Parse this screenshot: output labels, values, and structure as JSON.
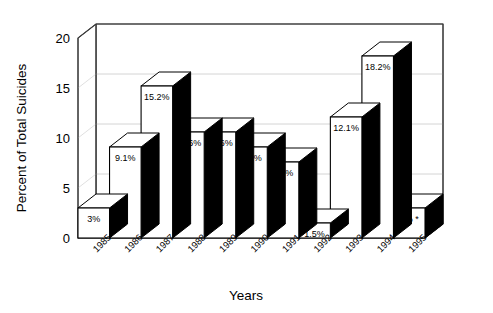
{
  "chart_data": {
    "type": "bar",
    "title": "",
    "subtitle": "",
    "xlabel": "Years",
    "ylabel": "Percent of Total Suicides",
    "categories": [
      "1985",
      "1986",
      "1987",
      "1988",
      "1989",
      "1990",
      "1991",
      "1992",
      "1993",
      "1994",
      "1995"
    ],
    "values": [
      3,
      9.1,
      15.2,
      10.6,
      10.6,
      9.1,
      7.6,
      1.5,
      12.1,
      18.2,
      3
    ],
    "data_labels": [
      "3%",
      "9.1%",
      "15.2%",
      "10.6%",
      "10.6%",
      "9.1%",
      "7.6%",
      "1.5%",
      "12.1%",
      "18.2%",
      "3% *"
    ],
    "ylim": [
      0,
      20
    ],
    "yticks": [
      0,
      5,
      10,
      15,
      20
    ],
    "ytick_labels": [
      "0",
      "5",
      "10",
      "15",
      "20"
    ],
    "grid": true,
    "legend": false,
    "legend_position": "none",
    "style": "3d-columns",
    "footnote_marker": "*",
    "colors": {
      "bar_face": "#ffffff",
      "bar_edge": "#000000",
      "bar_side": "#000000",
      "gridline": "#c9c9c9",
      "axis": "#3a3a3a",
      "background": "#ffffff",
      "text": "#000000"
    }
  },
  "axes": {
    "y_axis_name": "y-axis",
    "x_axis_name": "x-axis"
  }
}
